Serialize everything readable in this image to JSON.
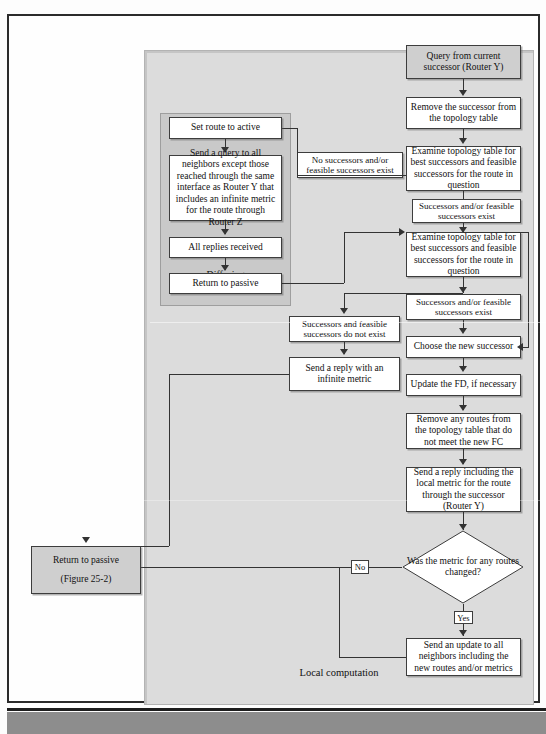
{
  "figure": {
    "panels": {
      "local_computation": "Local computation",
      "diffusing_computation": "Diffusing\ncomputation"
    }
  },
  "nodes": {
    "query_from_successor": "Query from current successor (Router Y)",
    "remove_successor": "Remove the successor from the topology table",
    "examine_topology_1": "Examine topology table for best successors and feasible successors for the route in question",
    "successors_exist_1": "Successors and/or feasible successors exist",
    "examine_topology_2": "Examine topology table for best successors and feasible successors for the route in question",
    "successors_exist_2": "Successors and/or feasible successors exist",
    "choose_new_successor": "Choose the new successor",
    "update_fd": "Update the FD, if necessary",
    "remove_routes": "Remove any routes from the topology table that do not meet the new FC",
    "send_reply_local_metric": "Send a reply including the local metric for the route through the successor (Router Y)",
    "decision_metric_changed": "Was the metric for any routes changed?",
    "send_update_all": "Send an update to all neighbors including the new routes and/or metrics",
    "no_successors_exist": "No successors and/or feasible successors exist",
    "successors_do_not_exist": "Successors and feasible successors do not exist",
    "send_reply_infinite": "Send a reply with an infinite metric",
    "set_route_active": "Set route to active",
    "send_query_all": "Send a query to all neighbors except  those reached through the same interface as Router Y that includes an infinite metric for the route through Router Z",
    "all_replies_received": "All replies received",
    "return_to_passive": "Return to passive",
    "return_to_passive_final": "Return to passive",
    "return_to_passive_final_ref": "(Figure 25-2)"
  },
  "edge_labels": {
    "no": "No",
    "yes": "Yes"
  },
  "colors": {
    "local_panel": "#dcdcdc",
    "diffusing_panel": "#c9c9c9",
    "node_fill": "#ffffff",
    "node_shaded_fill": "#cfcfcf",
    "stroke": "#3d3d3d",
    "page_border": "#2b2b2b",
    "footer_band": "#8d8d8d"
  }
}
